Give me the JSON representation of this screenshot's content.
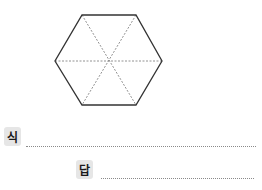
{
  "figure": {
    "shape": "regular-hexagon",
    "divisions": 6,
    "outline_color": "#333333",
    "divider_color": "#777777"
  },
  "answer_area": {
    "expression_label": "식",
    "answer_label": "답"
  }
}
